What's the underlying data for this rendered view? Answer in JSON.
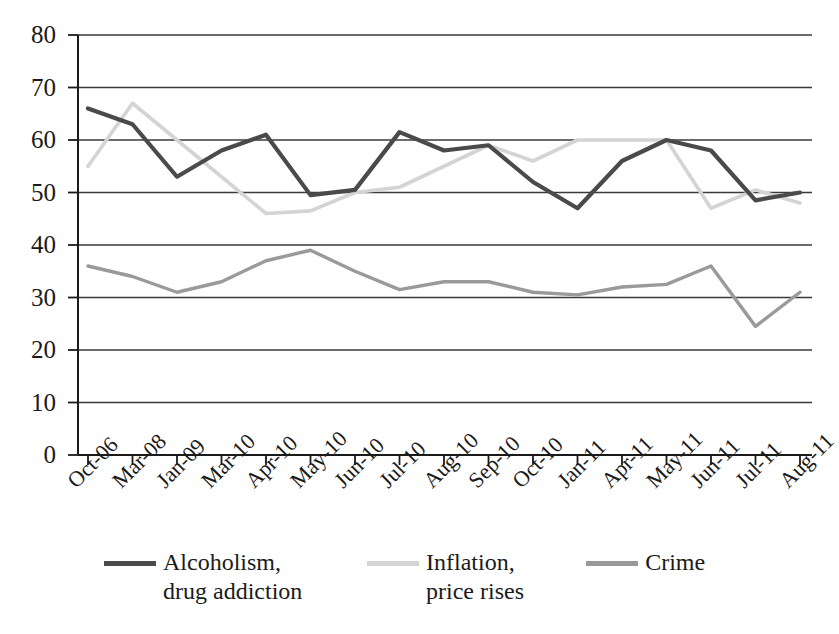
{
  "chart_data": {
    "type": "line",
    "title": "",
    "xlabel": "",
    "ylabel": "",
    "ylim": [
      0,
      80
    ],
    "ytick_step": 10,
    "grid": true,
    "legend_position": "bottom",
    "categories": [
      "Oct-06",
      "Mar-08",
      "Jan-09",
      "Mar-10",
      "Apr-10",
      "May-10",
      "Jun-10",
      "Jul-10",
      "Aug-10",
      "Sep-10",
      "Oct-10",
      "Jan-11",
      "Apr-11",
      "May-11",
      "Jun-11",
      "Jul-11",
      "Aug-11"
    ],
    "ytick_labels": [
      "80",
      "70",
      "60",
      "50",
      "40",
      "30",
      "20",
      "10",
      "0"
    ],
    "series": [
      {
        "name": "Alcoholism,\ndrug addiction",
        "color": "#4a4a4a",
        "values": [
          66,
          63,
          53,
          58,
          61,
          49.5,
          50.5,
          61.5,
          58,
          59,
          52,
          47,
          56,
          60,
          58,
          48.5,
          50
        ]
      },
      {
        "name": "Inflation,\nprice rises",
        "color": "#d4d4d4",
        "values": [
          55,
          67,
          60,
          53,
          46,
          46.5,
          50,
          51,
          55,
          59,
          56,
          60,
          60,
          60,
          47,
          50.5,
          48
        ]
      },
      {
        "name": "Crime",
        "color": "#9a9a9a",
        "values": [
          36,
          34,
          31,
          33,
          37,
          39,
          35,
          31.5,
          33,
          33,
          31,
          30.5,
          32,
          32.5,
          36,
          24.5,
          31
        ]
      }
    ]
  }
}
